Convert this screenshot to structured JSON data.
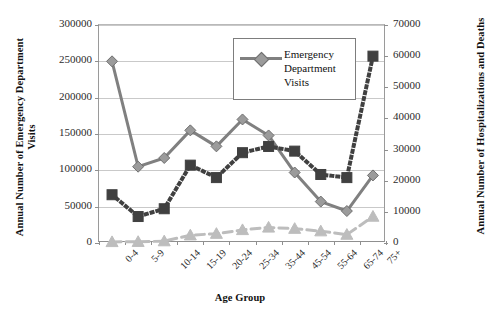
{
  "chart_data": {
    "type": "line",
    "title": "",
    "xlabel": "Age Group",
    "ylabel": "Annual Number of Emergency Department Visits",
    "ylabel_secondary": "Annual Number of Hospitalizations and Deaths",
    "categories": [
      "0-4",
      "5-9",
      "10-14",
      "15-19",
      "20-24",
      "25-34",
      "35-44",
      "45-54",
      "55-64",
      "65-74",
      "75+"
    ],
    "ylim": [
      0,
      300000
    ],
    "yticks": [
      "0",
      "50000",
      "100000",
      "150000",
      "200000",
      "250000",
      "300000"
    ],
    "ylim_secondary": [
      0,
      70000
    ],
    "yticks_secondary": [
      "0",
      "10000",
      "20000",
      "30000",
      "40000",
      "50000",
      "60000",
      "70000"
    ],
    "grid": true,
    "legend_position": "top-right-inset",
    "series": [
      {
        "name": "Emergency Department Visits",
        "axis": "left",
        "marker": "diamond",
        "linestyle": "solid",
        "color": "#808080",
        "values": [
          250000,
          105000,
          117000,
          155000,
          133000,
          170000,
          148000,
          97000,
          57000,
          44000,
          93000
        ]
      },
      {
        "name": "Hospitalizations",
        "axis": "right",
        "marker": "square",
        "linestyle": "dotted",
        "color": "#404040",
        "values": [
          15500,
          8500,
          11000,
          25000,
          21000,
          29000,
          31000,
          29500,
          22000,
          21000,
          60000
        ]
      },
      {
        "name": "Deaths",
        "axis": "right",
        "marker": "triangle",
        "linestyle": "dashed",
        "color": "#bdbdbd",
        "values": [
          350,
          400,
          600,
          2500,
          3000,
          4200,
          5000,
          4600,
          3800,
          2700,
          8500
        ]
      }
    ]
  },
  "legend": {
    "entries": [
      {
        "label": "Emergency Department Visits"
      }
    ]
  },
  "axes": {
    "x_title": "Age Group",
    "y_left_title": "Annual Number of Emergency Department Visits",
    "y_right_title": "Annual Number of Hospitalizations and Deaths"
  },
  "colors": {
    "ed_visits": "#808080",
    "hospitalizations": "#404040",
    "deaths": "#bdbdbd",
    "gridline": "#c9c9c9",
    "axis": "#8f8f8f",
    "text": "#2b2b2b"
  }
}
